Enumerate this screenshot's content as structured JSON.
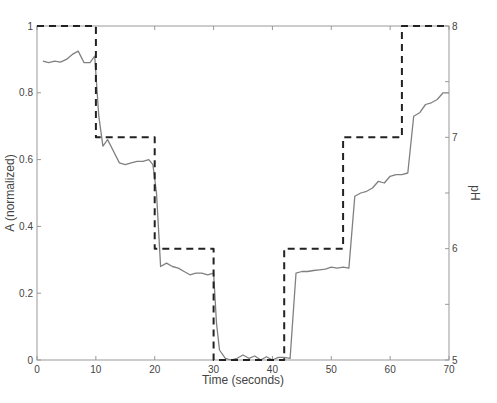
{
  "chart_data": {
    "type": "line",
    "title": "",
    "xlabel": "Time (seconds)",
    "ylabel": "A (normalized)",
    "y2label": "pH",
    "xlim": [
      0,
      70
    ],
    "ylim": [
      0,
      1
    ],
    "y2lim": [
      5,
      8
    ],
    "grid": false,
    "legend": "none",
    "x_ticks": [
      0,
      10,
      20,
      30,
      40,
      50,
      60,
      70
    ],
    "y_ticks": [
      0,
      0.2,
      0.4,
      0.6,
      0.8,
      1
    ],
    "y_tick_labels": [
      "0",
      "0.2",
      "0.4",
      "0.6",
      "0.8",
      "1"
    ],
    "y2_ticks": [
      5,
      6,
      7,
      8
    ],
    "y2_minor_ticks": [
      5.5,
      6.5,
      7.5
    ],
    "series": [
      {
        "name": "A (normalized)",
        "axis": "left",
        "style": "solid",
        "color": "#808080",
        "x": [
          1,
          2,
          3,
          4,
          5,
          6,
          7,
          8,
          9,
          9.8,
          10.5,
          11.2,
          12,
          13,
          14,
          15,
          16,
          17,
          18,
          19,
          19.7,
          20.3,
          21,
          22,
          23,
          24,
          25,
          26,
          27,
          28,
          29,
          30,
          30.5,
          31,
          32,
          33,
          34,
          35,
          36,
          37,
          38,
          39,
          40,
          41,
          42,
          43,
          44,
          45,
          46,
          47,
          48,
          49,
          50,
          51,
          52,
          53,
          54,
          55,
          56,
          57,
          58,
          59,
          60,
          61,
          62,
          63,
          64,
          65,
          66,
          67,
          68,
          69,
          70
        ],
        "values": [
          0.895,
          0.89,
          0.895,
          0.892,
          0.9,
          0.915,
          0.925,
          0.89,
          0.89,
          0.91,
          0.73,
          0.64,
          0.66,
          0.625,
          0.59,
          0.585,
          0.59,
          0.595,
          0.595,
          0.6,
          0.585,
          0.5,
          0.28,
          0.29,
          0.28,
          0.275,
          0.265,
          0.255,
          0.26,
          0.26,
          0.255,
          0.26,
          0.11,
          0.03,
          0.005,
          0.0,
          0.005,
          0.015,
          0.005,
          0.012,
          0.0,
          0.01,
          0.0,
          0.008,
          0.008,
          0.005,
          0.26,
          0.265,
          0.265,
          0.268,
          0.27,
          0.272,
          0.278,
          0.275,
          0.278,
          0.275,
          0.49,
          0.5,
          0.505,
          0.515,
          0.535,
          0.53,
          0.55,
          0.555,
          0.555,
          0.56,
          0.73,
          0.74,
          0.765,
          0.77,
          0.78,
          0.8,
          0.8
        ]
      },
      {
        "name": "pH",
        "axis": "right",
        "style": "dashed",
        "color": "#222222",
        "x": [
          0,
          10,
          10,
          20,
          20,
          30,
          30,
          42,
          42,
          52,
          52,
          62,
          62,
          70
        ],
        "values": [
          8,
          8,
          7,
          7,
          6,
          6,
          5,
          5,
          6,
          6,
          7,
          7,
          8,
          8
        ]
      }
    ]
  }
}
